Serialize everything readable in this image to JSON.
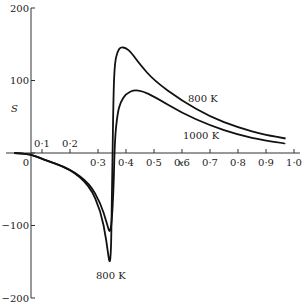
{
  "chart_data": {
    "type": "line",
    "title": "",
    "xlabel": "x",
    "ylabel": "S",
    "xlim": [
      0,
      1.0
    ],
    "ylim": [
      -200,
      200
    ],
    "x_ticks": [
      "0",
      "0·1",
      "0·2",
      "0·3",
      "0·4",
      "0·5",
      "0·6",
      "0·7",
      "0·8",
      "0·9",
      "1·0"
    ],
    "y_ticks": [
      "200",
      "100",
      "0",
      "−100",
      "−200"
    ],
    "grid": false,
    "legend": "inline curve labels",
    "series": [
      {
        "name": "800 K",
        "x": [
          -0.06,
          0.0,
          0.1,
          0.2,
          0.27,
          0.31,
          0.33,
          0.345,
          0.35,
          0.355,
          0.36,
          0.37,
          0.38,
          0.4,
          0.42,
          0.45,
          0.5,
          0.6,
          0.7,
          0.8,
          0.9,
          0.97
        ],
        "values": [
          0,
          -2,
          -8,
          -22,
          -45,
          -80,
          -120,
          -165,
          -60,
          80,
          125,
          140,
          146,
          145,
          138,
          122,
          100,
          72,
          50,
          35,
          25,
          20
        ]
      },
      {
        "name": "1000 K",
        "x": [
          -0.06,
          0.0,
          0.1,
          0.2,
          0.27,
          0.31,
          0.33,
          0.345,
          0.355,
          0.36,
          0.37,
          0.38,
          0.4,
          0.43,
          0.46,
          0.5,
          0.6,
          0.7,
          0.8,
          0.9,
          0.97
        ],
        "values": [
          0,
          -2,
          -8,
          -22,
          -42,
          -70,
          -95,
          -115,
          -60,
          20,
          55,
          70,
          82,
          87,
          85,
          78,
          55,
          38,
          25,
          17,
          13
        ]
      }
    ],
    "annotations": [
      {
        "text": "800 K",
        "near": "upper curve, x≈0.65"
      },
      {
        "text": "1000 K",
        "near": "lower curve, x≈0.63"
      },
      {
        "text": "800 K",
        "near": "minimum, x≈0.35, S≈−165"
      }
    ]
  },
  "labels": {
    "ylabel": "S",
    "xlabel": "x",
    "curve_800_upper": "800 K",
    "curve_1000": "1000 K",
    "curve_800_lower": "800 K",
    "zero": "0"
  }
}
